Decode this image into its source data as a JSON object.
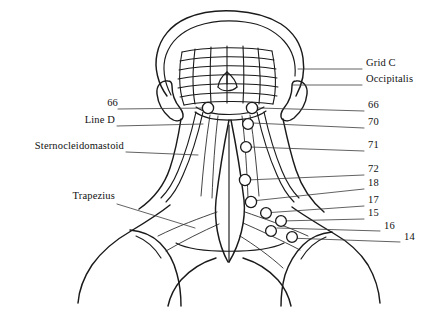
{
  "figure": {
    "background_color": "#ffffff",
    "ink_color": "#1a1a1a",
    "leader_color": "#3a3a3a"
  },
  "labels_right": [
    {
      "id": "grid-c",
      "text": "Grid C",
      "x": 366,
      "y": 64,
      "leader_from_x": 362,
      "leader_from_y": 69,
      "leader_to_x": 298,
      "leader_to_y": 69
    },
    {
      "id": "occipitalis",
      "text": "Occipitalis",
      "x": 366,
      "y": 80,
      "leader_from_x": 362,
      "leader_from_y": 85,
      "leader_to_x": 292,
      "leader_to_y": 85
    },
    {
      "id": "point-66r",
      "text": "66",
      "x": 368,
      "y": 106,
      "leader_from_x": 364,
      "leader_from_y": 111,
      "leader_to_x": 258,
      "leader_to_y": 108
    },
    {
      "id": "point-70",
      "text": "70",
      "x": 368,
      "y": 123,
      "leader_from_x": 364,
      "leader_from_y": 128,
      "leader_to_x": 252,
      "leader_to_y": 123
    },
    {
      "id": "point-71",
      "text": "71",
      "x": 368,
      "y": 146,
      "leader_from_x": 364,
      "leader_from_y": 151,
      "leader_to_x": 250,
      "leader_to_y": 147
    },
    {
      "id": "point-72",
      "text": "72",
      "x": 368,
      "y": 170,
      "leader_from_x": 364,
      "leader_from_y": 175,
      "leader_to_x": 247,
      "leader_to_y": 180
    },
    {
      "id": "point-18",
      "text": "18",
      "x": 368,
      "y": 184,
      "leader_from_x": 364,
      "leader_from_y": 189,
      "leader_to_x": 252,
      "leader_to_y": 201
    },
    {
      "id": "point-17",
      "text": "17",
      "x": 368,
      "y": 201,
      "leader_from_x": 364,
      "leader_from_y": 206,
      "leader_to_x": 264,
      "leader_to_y": 213
    },
    {
      "id": "point-15",
      "text": "15",
      "x": 368,
      "y": 214,
      "leader_from_x": 364,
      "leader_from_y": 219,
      "leader_to_x": 281,
      "leader_to_y": 221
    },
    {
      "id": "point-16",
      "text": "16",
      "x": 384,
      "y": 227,
      "leader_from_x": 380,
      "leader_from_y": 231,
      "leader_to_x": 277,
      "leader_to_y": 228
    },
    {
      "id": "point-14",
      "text": "14",
      "x": 404,
      "y": 238,
      "leader_from_x": 400,
      "leader_from_y": 242,
      "leader_to_x": 288,
      "leader_to_y": 238
    }
  ],
  "labels_left": [
    {
      "id": "point-66l",
      "text": "66",
      "x": 100,
      "y": 104,
      "leader_from_x": 118,
      "leader_from_y": 109,
      "leader_to_x": 208,
      "leader_to_y": 108
    },
    {
      "id": "line-d",
      "text": "Line D",
      "x": 76,
      "y": 121,
      "leader_from_x": 117,
      "leader_from_y": 126,
      "leader_to_x": 203,
      "leader_to_y": 124
    },
    {
      "id": "sternocleidomastoid",
      "text": "Sternocleidomastoid",
      "x": 10,
      "y": 147,
      "leader_from_x": 126,
      "leader_from_y": 152,
      "leader_to_x": 198,
      "leader_to_y": 155
    },
    {
      "id": "trapezius",
      "text": "Trapezius",
      "x": 63,
      "y": 197,
      "leader_from_x": 117,
      "leader_from_y": 204,
      "leader_to_x": 195,
      "leader_to_y": 228
    }
  ],
  "markers": [
    {
      "id": "m-66-left",
      "cx": 208,
      "cy": 108,
      "r": 5.6
    },
    {
      "id": "m-66-right",
      "cx": 252,
      "cy": 108,
      "r": 5.6
    },
    {
      "id": "m-70",
      "cx": 248,
      "cy": 124,
      "r": 5.4
    },
    {
      "id": "m-71",
      "cx": 246,
      "cy": 147,
      "r": 5.4
    },
    {
      "id": "m-72",
      "cx": 245,
      "cy": 180,
      "r": 5.6
    },
    {
      "id": "m-18",
      "cx": 251,
      "cy": 202,
      "r": 5.6
    },
    {
      "id": "m-17",
      "cx": 266,
      "cy": 213,
      "r": 5.4
    },
    {
      "id": "m-15",
      "cx": 281,
      "cy": 221,
      "r": 5.4
    },
    {
      "id": "m-16",
      "cx": 271,
      "cy": 231,
      "r": 5.4
    },
    {
      "id": "m-14",
      "cx": 292,
      "cy": 237,
      "r": 5.4
    }
  ],
  "grid": {
    "name": "Grid C occipital mesh",
    "rows": 6,
    "cols": 7
  }
}
